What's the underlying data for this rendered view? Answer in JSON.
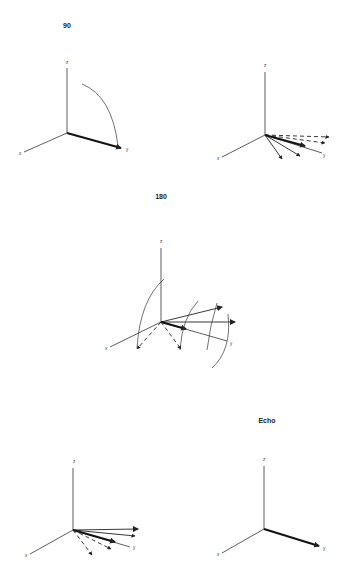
{
  "figure": {
    "panels": [
      {
        "id": "panel-90",
        "title": "90",
        "axis_labels": {
          "x": "x",
          "y": "y",
          "z": "z"
        },
        "description": "Magnetization vector along y after 90 degree pulse, arc showing tip from z to y"
      },
      {
        "id": "panel-dephasing",
        "title": "",
        "axis_labels": {
          "x": "x",
          "y": "y",
          "z": "z"
        },
        "description": "Spins fan out (dephase) in the xy-plane"
      },
      {
        "id": "panel-180",
        "title": "180",
        "axis_labels": {
          "x": "x",
          "y": "y",
          "z": "z"
        },
        "description": "180 degree pulse flips dephased spins, arcs indicate rotation"
      },
      {
        "id": "panel-rephasing",
        "title": "",
        "axis_labels": {
          "x": "x",
          "y": "y",
          "z": "z"
        },
        "description": "Spins rephase toward y axis"
      },
      {
        "id": "panel-echo",
        "title": "Echo",
        "axis_labels": {
          "x": "x",
          "y": "y",
          "z": "z"
        },
        "description": "Spins refocused along y producing echo"
      }
    ]
  }
}
